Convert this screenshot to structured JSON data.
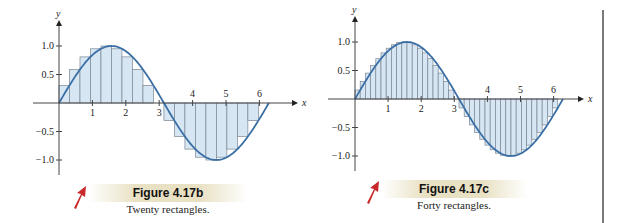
{
  "figures": [
    {
      "id": "fig-b",
      "title": "Figure 4.17b",
      "caption": "Twenty rectangles.",
      "rectangles": 20
    },
    {
      "id": "fig-c",
      "title": "Figure 4.17c",
      "caption": "Forty rectangles.",
      "rectangles": 40
    }
  ],
  "axes": {
    "xlabel": "x",
    "ylabel": "y",
    "x_ticks": [
      "1",
      "2",
      "3",
      "4",
      "5",
      "6"
    ],
    "y_ticks": [
      "1.0",
      "0.5",
      "-0.5",
      "-1.0"
    ]
  },
  "colors": {
    "curve": "#3a6ea5",
    "fill": "#d6e6f3",
    "rect_stroke": "#7b8794",
    "caption_band": "#e9e1c4",
    "pointer": "#c8282a"
  },
  "chart_data": [
    {
      "type": "area",
      "title": "Figure 4.17b",
      "subtitle": "Twenty rectangles.",
      "function": "y = sin(x)",
      "x": [
        0,
        6.2832
      ],
      "num_rectangles": 20,
      "xlabel": "x",
      "ylabel": "y",
      "xlim": [
        0,
        6.5
      ],
      "ylim": [
        -1.1,
        1.2
      ],
      "x_ticks": [
        1,
        2,
        3,
        4,
        5,
        6
      ],
      "y_ticks": [
        -1.0,
        -0.5,
        0.5,
        1.0
      ],
      "grid": false
    },
    {
      "type": "area",
      "title": "Figure 4.17c",
      "subtitle": "Forty rectangles.",
      "function": "y = sin(x)",
      "x": [
        0,
        6.2832
      ],
      "num_rectangles": 40,
      "xlabel": "x",
      "ylabel": "y",
      "xlim": [
        0,
        6.5
      ],
      "ylim": [
        -1.1,
        1.2
      ],
      "x_ticks": [
        1,
        2,
        3,
        4,
        5,
        6
      ],
      "y_ticks": [
        -1.0,
        -0.5,
        0.5,
        1.0
      ],
      "grid": false
    }
  ]
}
